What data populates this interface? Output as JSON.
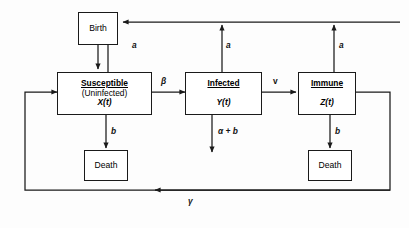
{
  "diagram": {
    "stroke_color": "#1a1a1a",
    "background": "#fdfdfd",
    "nodes": {
      "birth": {
        "label": "Birth"
      },
      "susceptible": {
        "title": "Susceptible",
        "subtitle": "(Uninfected)",
        "variable": "X(t)"
      },
      "infected": {
        "title": "Infected",
        "variable": "Y(t)"
      },
      "immune": {
        "title": "Immune",
        "variable": "Z(t)"
      },
      "death_left": {
        "label": "Death"
      },
      "death_right": {
        "label": "Death"
      }
    },
    "edge_labels": {
      "birth_rate_susceptible": "a",
      "birth_rate_infected": "a",
      "birth_rate_immune": "a",
      "infection_rate": "β",
      "recovery_rate": "v",
      "death_rate_susceptible": "b",
      "disease_death_rate_infected": "α + b",
      "death_rate_immune": "b",
      "loss_of_immunity_rate": "γ"
    }
  }
}
